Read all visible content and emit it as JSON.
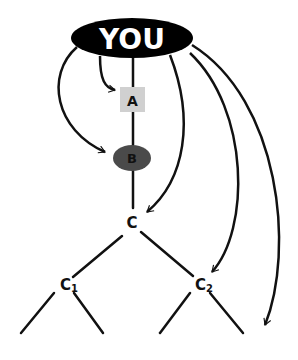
{
  "diagram": {
    "type": "hierarchy-with-direct-links",
    "nodes": {
      "you": {
        "label": "YOU",
        "shape": "ellipse",
        "fill": "#000000",
        "text_color": "#ffffff"
      },
      "a": {
        "label": "A",
        "shape": "rect",
        "fill": "#d0d0d0",
        "text_color": "#111111"
      },
      "b": {
        "label": "B",
        "shape": "ellipse",
        "fill": "#4a4a4a",
        "text_color": "#111111"
      },
      "c": {
        "label": "C",
        "shape": "text"
      },
      "c1": {
        "label": "C",
        "sub": "1",
        "shape": "text"
      },
      "c2": {
        "label": "C",
        "sub": "2",
        "shape": "text"
      }
    },
    "edges_tree": [
      [
        "you",
        "a"
      ],
      [
        "a",
        "b"
      ],
      [
        "b",
        "c"
      ],
      [
        "c",
        "c1"
      ],
      [
        "c",
        "c2"
      ],
      [
        "c1",
        "leaf1"
      ],
      [
        "c1",
        "leaf2"
      ],
      [
        "c2",
        "leaf3"
      ],
      [
        "c2",
        "leaf4"
      ]
    ],
    "arrows_from_you": [
      "a",
      "b",
      "c",
      "c2",
      "beyond-c2"
    ]
  }
}
